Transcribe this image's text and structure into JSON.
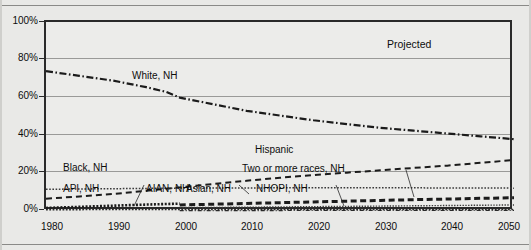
{
  "figure": {
    "annotations": {
      "projected": "Projected"
    }
  },
  "axes": {
    "y": {
      "ticks": [
        "100%",
        "80%",
        "60%",
        "40%",
        "20%",
        "0%"
      ],
      "min": 0,
      "max": 100,
      "unit": "%"
    },
    "x": {
      "ticks": [
        "1980",
        "1990",
        "2000",
        "2010",
        "2020",
        "2030",
        "2040",
        "2050"
      ],
      "min": 1980,
      "max": 2050
    }
  },
  "series_labels": [
    "White, NH",
    "Hispanic",
    "Black, NH",
    "Two or more races, NH",
    "API, NH",
    "AIAN, NH",
    "Asian, NH",
    "NHOPI, NH"
  ],
  "chart_data": {
    "type": "line",
    "title": "",
    "xlabel": "",
    "ylabel": "",
    "xlim": [
      1980,
      2050
    ],
    "ylim": [
      0,
      100
    ],
    "grid": true,
    "legend": "inline-annotations",
    "x": [
      1980,
      1990,
      2000,
      2010,
      2020,
      2030,
      2040,
      2050
    ],
    "series": [
      {
        "name": "White, NH",
        "style": "dash-dot",
        "color": "#1b1b1b",
        "values": [
          74,
          69,
          60,
          53,
          48,
          44,
          41,
          38
        ],
        "points": [
          [
            1980,
            74
          ],
          [
            1985,
            71.5
          ],
          [
            1990,
            69
          ],
          [
            1995,
            65.5
          ],
          [
            1998,
            63
          ],
          [
            2000,
            60
          ],
          [
            2005,
            56.5
          ],
          [
            2010,
            53
          ],
          [
            2015,
            50.5
          ],
          [
            2020,
            48
          ],
          [
            2025,
            46
          ],
          [
            2030,
            44
          ],
          [
            2035,
            42.5
          ],
          [
            2040,
            41
          ],
          [
            2045,
            39.5
          ],
          [
            2050,
            38
          ]
        ]
      },
      {
        "name": "Hispanic",
        "style": "dashed",
        "color": "#1b1b1b",
        "values": [
          6.5,
          9,
          12.5,
          16,
          19,
          21.5,
          24,
          27
        ],
        "points": [
          [
            1980,
            6.5
          ],
          [
            1985,
            7.7
          ],
          [
            1990,
            9
          ],
          [
            1995,
            10.7
          ],
          [
            2000,
            12.5
          ],
          [
            2005,
            14.3
          ],
          [
            2010,
            16
          ],
          [
            2015,
            17.6
          ],
          [
            2020,
            19
          ],
          [
            2025,
            20.3
          ],
          [
            2030,
            21.5
          ],
          [
            2035,
            22.8
          ],
          [
            2040,
            24
          ],
          [
            2045,
            25.5
          ],
          [
            2050,
            27
          ]
        ]
      },
      {
        "name": "Black, NH",
        "style": "dotted",
        "color": "#3a3a3a",
        "values": [
          11.5,
          11.8,
          12.1,
          12.2,
          12.3,
          12.3,
          12.2,
          12.1
        ],
        "points": [
          [
            1980,
            11.5
          ],
          [
            1990,
            11.8
          ],
          [
            2000,
            12.1
          ],
          [
            2010,
            12.2
          ],
          [
            2020,
            12.3
          ],
          [
            2030,
            12.3
          ],
          [
            2040,
            12.2
          ],
          [
            2050,
            12.1
          ]
        ]
      },
      {
        "name": "API, NH",
        "style": "dotted-thick",
        "color": "#1b1b1b",
        "values": [
          1.6,
          2.8,
          3.9,
          null,
          null,
          null,
          null,
          null
        ],
        "points": [
          [
            1980,
            1.6
          ],
          [
            1985,
            2.2
          ],
          [
            1990,
            2.8
          ],
          [
            1995,
            3.4
          ],
          [
            2000,
            3.9
          ]
        ]
      },
      {
        "name": "Asian, NH",
        "style": "dashed-thick",
        "color": "#1b1b1b",
        "values": [
          null,
          null,
          3.2,
          4.0,
          4.8,
          5.6,
          6.3,
          7.0
        ],
        "points": [
          [
            2000,
            3.2
          ],
          [
            2005,
            3.6
          ],
          [
            2010,
            4.0
          ],
          [
            2015,
            4.4
          ],
          [
            2020,
            4.8
          ],
          [
            2025,
            5.2
          ],
          [
            2030,
            5.6
          ],
          [
            2035,
            6.0
          ],
          [
            2040,
            6.3
          ],
          [
            2045,
            6.7
          ],
          [
            2050,
            7.0
          ]
        ]
      },
      {
        "name": "Two or more races, NH",
        "style": "thin-solid-dotted",
        "color": "#3a3a3a",
        "values": [
          null,
          null,
          1.8,
          2.0,
          2.3,
          2.6,
          2.9,
          3.2
        ],
        "points": [
          [
            2000,
            1.8
          ],
          [
            2010,
            2.0
          ],
          [
            2020,
            2.3
          ],
          [
            2030,
            2.6
          ],
          [
            2040,
            2.9
          ],
          [
            2050,
            3.2
          ]
        ]
      },
      {
        "name": "AIAN, NH",
        "style": "fine-dotted",
        "color": "#2a2a2a",
        "values": [
          0.7,
          0.8,
          0.8,
          0.8,
          0.8,
          0.8,
          0.8,
          0.8
        ],
        "points": [
          [
            1980,
            0.7
          ],
          [
            1990,
            0.8
          ],
          [
            2000,
            0.8
          ],
          [
            2010,
            0.8
          ],
          [
            2020,
            0.8
          ],
          [
            2030,
            0.8
          ],
          [
            2040,
            0.8
          ],
          [
            2050,
            0.8
          ]
        ]
      },
      {
        "name": "NHOPI, NH",
        "style": "fine-dash-dot",
        "color": "#2a2a2a",
        "values": [
          null,
          null,
          0.25,
          0.25,
          0.3,
          0.3,
          0.3,
          0.3
        ],
        "points": [
          [
            2000,
            0.25
          ],
          [
            2010,
            0.25
          ],
          [
            2020,
            0.3
          ],
          [
            2030,
            0.3
          ],
          [
            2040,
            0.3
          ],
          [
            2050,
            0.3
          ]
        ]
      }
    ]
  },
  "bleed_text": {
    "line1": "ETHNIC CONSIDERATIONS",
    "line2": "RESPONSE TO PRESCRIPTION"
  }
}
